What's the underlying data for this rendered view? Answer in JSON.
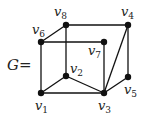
{
  "graph": {
    "name": "G",
    "equals": "=",
    "nodes": [
      {
        "id": "v1",
        "letter": "v",
        "sub": "1",
        "x": 41,
        "y": 93,
        "lx": 35,
        "ly": 110
      },
      {
        "id": "v2",
        "letter": "v",
        "sub": "2",
        "x": 66,
        "y": 76,
        "lx": 70,
        "ly": 73
      },
      {
        "id": "v3",
        "letter": "v",
        "sub": "3",
        "x": 104,
        "y": 93,
        "lx": 98,
        "ly": 110
      },
      {
        "id": "v4",
        "letter": "v",
        "sub": "4",
        "x": 128,
        "y": 25,
        "lx": 121,
        "ly": 16
      },
      {
        "id": "v5",
        "letter": "v",
        "sub": "5",
        "x": 128,
        "y": 77,
        "lx": 124,
        "ly": 94
      },
      {
        "id": "v6",
        "letter": "v",
        "sub": "6",
        "x": 41,
        "y": 42,
        "lx": 32,
        "ly": 34
      },
      {
        "id": "v7",
        "letter": "v",
        "sub": "7",
        "x": 104,
        "y": 42,
        "lx": 88,
        "ly": 55
      },
      {
        "id": "v8",
        "letter": "v",
        "sub": "8",
        "x": 66,
        "y": 25,
        "lx": 54,
        "ly": 16
      }
    ],
    "edges": [
      [
        "v1",
        "v6"
      ],
      [
        "v6",
        "v8"
      ],
      [
        "v8",
        "v4"
      ],
      [
        "v6",
        "v7"
      ],
      [
        "v7",
        "v3"
      ],
      [
        "v4",
        "v3"
      ],
      [
        "v4",
        "v5"
      ],
      [
        "v5",
        "v3"
      ],
      [
        "v8",
        "v2"
      ],
      [
        "v2",
        "v1"
      ],
      [
        "v2",
        "v3"
      ],
      [
        "v1",
        "v3"
      ]
    ]
  }
}
